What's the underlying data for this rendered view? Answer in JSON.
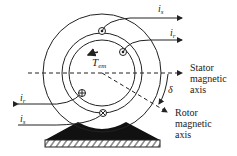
{
  "diagram": {
    "title": "",
    "labels": {
      "is_top": {
        "main": "i",
        "sub": "s"
      },
      "ir_top": {
        "main": "i",
        "sub": "r"
      },
      "ir_left": {
        "main": "i",
        "sub": "r"
      },
      "is_left": {
        "main": "i",
        "sub": "s"
      },
      "torque": {
        "main": "T",
        "sub": "em"
      },
      "delta": "δ",
      "stator_axis": [
        "Stator",
        "magnetic",
        "axis"
      ],
      "rotor_axis": [
        "Rotor",
        "magnetic",
        "axis"
      ]
    },
    "icons": [
      "dot-conductor-icon",
      "cross-conductor-icon",
      "arrow-icon"
    ],
    "colors": {
      "line": "#222222",
      "base": "#111111",
      "background": "#ffffff"
    }
  }
}
